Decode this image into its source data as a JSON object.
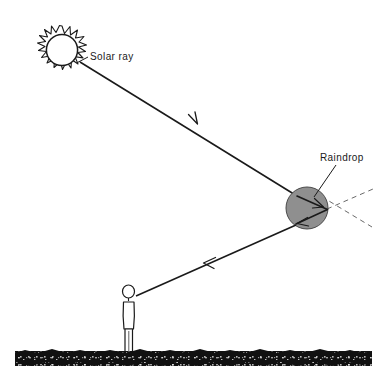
{
  "figure": {
    "background_color": "#ffffff",
    "ink_color": "#1a1a1a",
    "width": 383,
    "height": 381
  },
  "labels": {
    "solar_ray": "Solar ray",
    "raindrop": "Raindrop"
  },
  "elements": {
    "sun": {
      "name": "sun",
      "center_x": 62,
      "center_y": 50,
      "inner_radius": 16,
      "spike_radius": 24,
      "spike_count": 18,
      "fill": "#ffffff",
      "stroke": "#1a1a1a"
    },
    "raindrop": {
      "name": "raindrop",
      "center_x": 307,
      "center_y": 208,
      "radius": 21,
      "fill": "#8f8f8f",
      "stroke": "#3a3a3a"
    },
    "observer": {
      "name": "observer-person",
      "head_center_x": 128,
      "head_center_y": 291,
      "head_radius": 6,
      "ground_y": 352
    },
    "ground": {
      "name": "ground-strip",
      "x": 15,
      "y": 351,
      "width": 357,
      "height": 15,
      "fill": "#111111"
    },
    "incoming_ray": {
      "name": "incoming-solar-ray",
      "from_x": 80,
      "from_y": 62,
      "to_x": 297,
      "to_y": 196,
      "arrow_x": 196,
      "arrow_y": 123
    },
    "outgoing_ray": {
      "name": "outgoing-reflected-ray",
      "from_x": 296,
      "from_y": 224,
      "to_x": 136,
      "to_y": 296,
      "arrow_x": 205,
      "arrow_y": 265
    },
    "internal_path": {
      "name": "internal-reflection-path",
      "entry_x": 297,
      "entry_y": 196,
      "reflect_x": 327,
      "reflect_y": 209,
      "exit_x": 296,
      "exit_y": 224
    },
    "dashed_extension_a": {
      "name": "dashed-axis-line",
      "from_x": 317,
      "from_y": 196,
      "to_x": 371,
      "to_y": 226
    },
    "dashed_extension_b": {
      "name": "dashed-refraction-line",
      "from_x": 327,
      "from_y": 209,
      "to_x": 372,
      "to_y": 190
    },
    "solar_ray_leader": {
      "name": "solar-ray-leader-line",
      "from_x": 88,
      "from_y": 56,
      "to_x": 78,
      "to_y": 62
    },
    "raindrop_leader": {
      "name": "raindrop-leader-line",
      "from_x": 336,
      "from_y": 163,
      "to_x": 314,
      "to_y": 196
    }
  },
  "label_positions": {
    "solar_ray": {
      "x": 90,
      "y": 59
    },
    "raindrop": {
      "x": 322,
      "y": 159
    }
  }
}
